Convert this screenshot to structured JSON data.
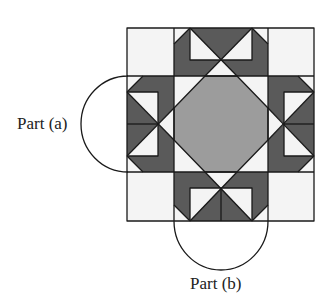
{
  "figure": {
    "type": "quilt-block-diagram",
    "grid": {
      "rows": 3,
      "cols": 3
    },
    "colors": {
      "background": "#ffffff",
      "light": "#f4f4f4",
      "dark": "#5a5a5a",
      "medium": "#9c9c9c",
      "line": "#1a1a1a"
    },
    "labels": {
      "part_a": "Part (a)",
      "part_b": "Part (b)"
    }
  }
}
